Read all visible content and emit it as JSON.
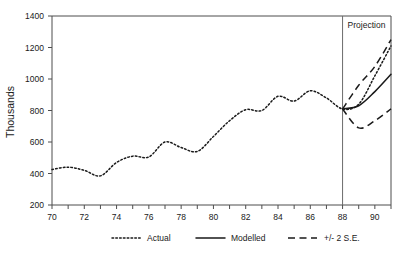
{
  "chart_data": {
    "type": "line",
    "title": "",
    "xlabel": "",
    "ylabel": "Thousands",
    "xlim": [
      70,
      91
    ],
    "ylim": [
      200,
      1400
    ],
    "yticks": [
      200,
      400,
      600,
      800,
      1000,
      1200,
      1400
    ],
    "ytick_labels": [
      "200",
      "400",
      "600",
      "800",
      "1000",
      "1200",
      "1400"
    ],
    "xticks": [
      70,
      71,
      72,
      73,
      74,
      75,
      76,
      77,
      78,
      79,
      80,
      81,
      82,
      83,
      84,
      85,
      86,
      87,
      88,
      89,
      90,
      91
    ],
    "xtick_labels_shown": [
      "70",
      "72",
      "74",
      "76",
      "78",
      "80",
      "82",
      "84",
      "86",
      "88",
      "90"
    ],
    "xtick_label_values": [
      70,
      72,
      74,
      76,
      78,
      80,
      82,
      84,
      86,
      88,
      90
    ],
    "grid": false,
    "legend_position": "bottom",
    "annotations": [
      {
        "text": "Projection",
        "x": 88,
        "type": "region-divider-label"
      }
    ],
    "divider_x": 88,
    "series": [
      {
        "name": "Actual",
        "style": "dotted",
        "color": "#1a1a1a",
        "x": [
          70,
          71,
          72,
          73,
          74,
          75,
          76,
          77,
          78,
          79,
          80,
          81,
          82,
          83,
          84,
          85,
          86,
          87,
          88,
          89,
          90,
          91
        ],
        "values": [
          425,
          440,
          420,
          385,
          470,
          510,
          505,
          600,
          565,
          540,
          635,
          735,
          805,
          800,
          890,
          860,
          925,
          880,
          810,
          840,
          1020,
          1210
        ]
      },
      {
        "name": "Modelled",
        "style": "solid",
        "color": "#1a1a1a",
        "x": [
          88,
          89,
          90,
          91
        ],
        "values": [
          810,
          830,
          920,
          1030
        ]
      },
      {
        "name": "+/- 2 S.E. upper",
        "style": "dashed",
        "color": "#1a1a1a",
        "x": [
          88,
          89,
          90,
          91
        ],
        "values": [
          810,
          960,
          1080,
          1250
        ]
      },
      {
        "name": "+/- 2 S.E. lower",
        "style": "dashed",
        "color": "#1a1a1a",
        "x": [
          88,
          89,
          90,
          91
        ],
        "values": [
          810,
          690,
          735,
          810
        ]
      }
    ],
    "legend": [
      {
        "label": "Actual",
        "style": "dotted"
      },
      {
        "label": "Modelled",
        "style": "solid"
      },
      {
        "label": "+/- 2 S.E.",
        "style": "dashed"
      }
    ]
  }
}
